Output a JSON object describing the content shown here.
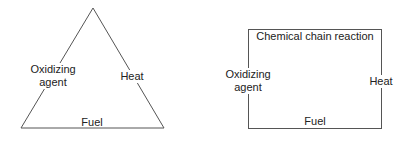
{
  "diagrams": [
    {
      "name": "fire-triangle",
      "shape": "triangle",
      "labels": {
        "left": "Oxidizing\nagent",
        "left_line1": "Oxidizing",
        "left_line2": "agent",
        "right": "Heat",
        "bottom": "Fuel"
      }
    },
    {
      "name": "fire-tetrahedron",
      "shape": "rectangle",
      "labels": {
        "top": "Chemical chain reaction",
        "left_line1": "Oxidizing",
        "left_line2": "agent",
        "right": "Heat",
        "bottom": "Fuel"
      }
    }
  ],
  "colors": {
    "line": "#555555",
    "text": "#222222",
    "background": "#ffffff"
  }
}
